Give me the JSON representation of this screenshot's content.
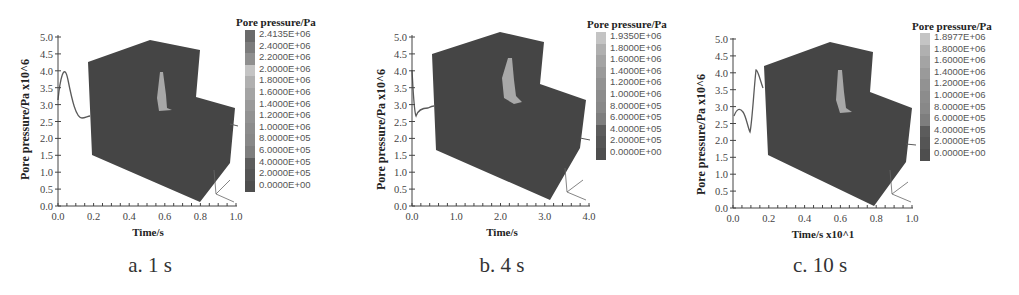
{
  "figure": {
    "colorbar_title": "Pore pressure/Pa",
    "ylabel": "Pore pressure/Pa x10^6",
    "panels": [
      {
        "id": "a",
        "caption": "a. 1 s",
        "xlabel": "Time/s",
        "xticks": [
          "0.0",
          "0.2",
          "0.4",
          "0.6",
          "0.8",
          "1.0"
        ],
        "yticks": [
          "0.0",
          "0.5",
          "1.0",
          "1.5",
          "2.0",
          "2.5",
          "3.0",
          "3.5",
          "4.0",
          "4.5",
          "5.0"
        ],
        "colorbar_labels": [
          "2.4135E+06",
          "2.4000E+06",
          "2.2000E+06",
          "2.0000E+06",
          "1.8000E+06",
          "1.6000E+06",
          "1.4000E+06",
          "1.2000E+06",
          "1.0000E+06",
          "8.0000E+05",
          "6.0000E+05",
          "4.0000E+05",
          "2.0000E+05",
          "0.0000E+00"
        ]
      },
      {
        "id": "b",
        "caption": "b. 4 s",
        "xlabel": "Time/s",
        "xticks": [
          "0.0",
          "1.0",
          "2.0",
          "3.0",
          "4.0"
        ],
        "yticks": [
          "0.0",
          "0.5",
          "1.0",
          "1.5",
          "2.0",
          "2.5",
          "3.0",
          "3.5",
          "4.0",
          "4.5",
          "5.0"
        ],
        "colorbar_labels": [
          "1.9350E+06",
          "1.8000E+06",
          "1.6000E+06",
          "1.4000E+06",
          "1.2000E+06",
          "1.0000E+06",
          "8.0000E+05",
          "6.0000E+05",
          "4.0000E+05",
          "2.0000E+05",
          "0.0000E+00"
        ]
      },
      {
        "id": "c",
        "caption": "c. 10 s",
        "xlabel": "Time/s x10^1",
        "xticks": [
          "0.0",
          "0.2",
          "0.4",
          "0.6",
          "0.8",
          "1.0"
        ],
        "yticks": [
          "0.0",
          "0.5",
          "1.0",
          "1.5",
          "2.0",
          "2.5",
          "3.0",
          "3.5",
          "4.0",
          "4.5",
          "5.0"
        ],
        "colorbar_labels": [
          "1.8977E+06",
          "1.8000E+06",
          "1.6000E+06",
          "1.4000E+06",
          "1.2000E+06",
          "1.0000E+06",
          "8.0000E+05",
          "6.0000E+05",
          "4.0000E+05",
          "2.0000E+05",
          "0.0000E+00"
        ]
      }
    ],
    "colors": {
      "cube": "#454545",
      "plume": "#a8a8a8",
      "curve": "#5a5a5a",
      "axis": "#444444"
    }
  },
  "chart_data": [
    {
      "type": "line",
      "title": "a. 1 s",
      "xlabel": "Time/s",
      "ylabel": "Pore pressure/Pa x10^6",
      "xlim": [
        0.0,
        1.0
      ],
      "ylim": [
        0.0,
        5.0
      ],
      "series": [
        {
          "name": "pore pressure",
          "x": [
            0.0,
            0.02,
            0.04,
            0.07,
            0.1,
            0.13,
            0.16
          ],
          "y": [
            3.4,
            3.9,
            4.0,
            3.3,
            2.75,
            2.7,
            2.75
          ]
        }
      ],
      "colorbar": {
        "title": "Pore pressure/Pa",
        "min": 0.0,
        "max": 2413500
      }
    },
    {
      "type": "line",
      "title": "b. 4 s",
      "xlabel": "Time/s",
      "ylabel": "Pore pressure/Pa x10^6",
      "xlim": [
        0.0,
        4.0
      ],
      "ylim": [
        0.0,
        5.0
      ],
      "series": [
        {
          "name": "pore pressure",
          "x": [
            0.0,
            0.05,
            0.15,
            0.25,
            0.4,
            0.55
          ],
          "y": [
            4.0,
            3.6,
            2.7,
            2.85,
            2.85,
            2.95
          ]
        }
      ],
      "colorbar": {
        "title": "Pore pressure/Pa",
        "min": 0.0,
        "max": 1935000
      }
    },
    {
      "type": "line",
      "title": "c. 10 s",
      "xlabel": "Time/s x10^1",
      "ylabel": "Pore pressure/Pa x10^6",
      "xlim": [
        0.0,
        1.0
      ],
      "ylim": [
        0.0,
        5.0
      ],
      "series": [
        {
          "name": "pore pressure",
          "x": [
            0.0,
            0.03,
            0.06,
            0.09,
            0.11,
            0.14,
            0.16
          ],
          "y": [
            2.7,
            3.0,
            2.9,
            2.3,
            3.0,
            4.1,
            3.6
          ]
        }
      ],
      "colorbar": {
        "title": "Pore pressure/Pa",
        "min": 0.0,
        "max": 1897700
      }
    }
  ]
}
